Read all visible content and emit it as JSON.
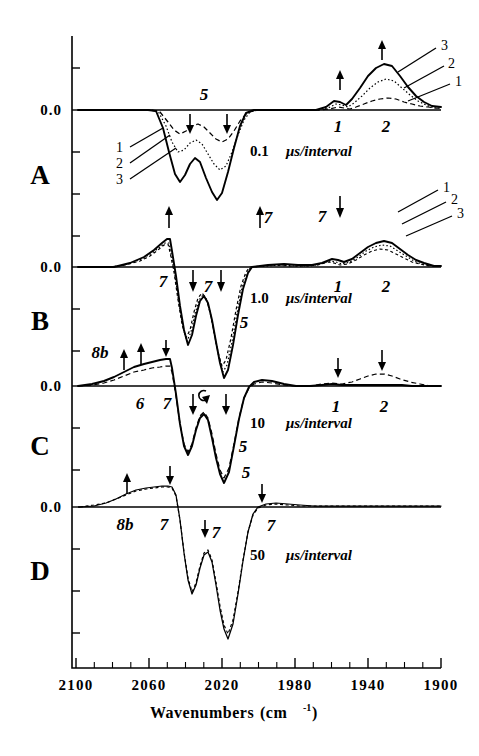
{
  "figure": {
    "kind": "trir-difference-spectra",
    "x_title_main": "Wavenumbers",
    "x_title_unit_open": "(cm",
    "x_title_unit_sup": "-1",
    "x_title_unit_close": ")",
    "zero_label": "0.0"
  },
  "xaxis": {
    "ticks": [
      "2100",
      "2060",
      "2020",
      "1980",
      "1940",
      "1900"
    ],
    "min": 1900,
    "max": 2100,
    "reversed": true,
    "minor_step": 10
  },
  "panels": [
    {
      "letter": "A",
      "interval_value": "0.1",
      "interval_unit": "μs/interval",
      "trace_labels": [
        "1",
        "2",
        "3"
      ],
      "band_labels": [
        "5",
        "1",
        "2"
      ]
    },
    {
      "letter": "B",
      "interval_value": "1.0",
      "interval_unit": "μs/interval",
      "trace_labels": [
        "1",
        "2",
        "3"
      ],
      "band_labels": [
        "7",
        "7",
        "7",
        "7",
        "5",
        "1",
        "2"
      ]
    },
    {
      "letter": "C",
      "interval_value": "10",
      "interval_unit": "μs/interval",
      "trace_labels": [],
      "band_labels": [
        "8b",
        "6",
        "7",
        "5",
        "1",
        "2"
      ]
    },
    {
      "letter": "D",
      "interval_value": "50",
      "interval_unit": "μs/interval",
      "trace_labels": [],
      "band_labels": [
        "8b",
        "7",
        "7",
        "7",
        "5"
      ]
    }
  ],
  "chart_data": {
    "type": "line",
    "title": "",
    "xlabel": "Wavenumbers (cm-1)",
    "ylabel": "0.0",
    "xlim": [
      2100,
      1900
    ],
    "x_reversed": true,
    "grid": false,
    "legend": "inline trace numbers 1, 2, 3 with leader lines",
    "subplots": [
      {
        "panel": "A",
        "interval": "0.1 μs/interval",
        "annotations": [
          {
            "text": "5",
            "wavenumber": 2032,
            "direction": "negative",
            "arrows": [
              "down",
              "down"
            ]
          },
          {
            "text": "1",
            "wavenumber": 1948,
            "direction": "positive",
            "arrows": [
              "up"
            ]
          },
          {
            "text": "2",
            "wavenumber": 1930,
            "direction": "positive",
            "arrows": [
              "up"
            ]
          }
        ],
        "series": [
          {
            "name": "1",
            "style": "dashed",
            "bands": [
              {
                "center": 2042,
                "amplitude": -0.2,
                "width": 7
              },
              {
                "center": 2025,
                "amplitude": -0.26,
                "width": 8
              },
              {
                "center": 1948,
                "amplitude": 0.05,
                "width": 4
              },
              {
                "center": 1931,
                "amplitude": 0.17,
                "width": 13
              }
            ]
          },
          {
            "name": "2",
            "style": "dotted",
            "bands": [
              {
                "center": 2042,
                "amplitude": -0.42,
                "width": 7
              },
              {
                "center": 2025,
                "amplitude": -0.52,
                "width": 8
              },
              {
                "center": 1948,
                "amplitude": 0.07,
                "width": 4
              },
              {
                "center": 1931,
                "amplitude": 0.36,
                "width": 13
              }
            ]
          },
          {
            "name": "3",
            "style": "solid",
            "bands": [
              {
                "center": 2042,
                "amplitude": -0.62,
                "width": 7
              },
              {
                "center": 2025,
                "amplitude": -0.9,
                "width": 8
              },
              {
                "center": 1948,
                "amplitude": 0.09,
                "width": 4
              },
              {
                "center": 1931,
                "amplitude": 0.58,
                "width": 13
              }
            ]
          }
        ]
      },
      {
        "panel": "B",
        "interval": "1.0 μs/interval",
        "annotations": [
          {
            "text": "7",
            "wavenumber": 2060,
            "direction": "positive",
            "arrows": [
              "up"
            ]
          },
          {
            "text": "7",
            "wavenumber": 2040,
            "direction": "negative",
            "arrows": [
              "down"
            ]
          },
          {
            "text": "7",
            "wavenumber": 2022,
            "direction": "negative",
            "arrows": [
              "down"
            ]
          },
          {
            "text": "7",
            "wavenumber": 1992,
            "direction": "positive",
            "arrows": [
              "up"
            ]
          },
          {
            "text": "5",
            "wavenumber": 2008,
            "direction": "negative",
            "arrows": []
          },
          {
            "text": "1",
            "wavenumber": 1948,
            "direction": "positive",
            "arrows": [
              "down"
            ]
          },
          {
            "text": "2",
            "wavenumber": 1930,
            "direction": "positive",
            "arrows": [
              "down"
            ]
          }
        ],
        "series": [
          {
            "name": "3",
            "style": "solid",
            "bands": [
              {
                "center": 2063,
                "amplitude": 0.22,
                "width": 12
              },
              {
                "center": 2040,
                "amplitude": -0.74,
                "width": 7
              },
              {
                "center": 2012,
                "amplitude": -1.0,
                "width": 9
              },
              {
                "center": 1931,
                "amplitude": 0.22,
                "width": 14
              }
            ]
          },
          {
            "name": "2",
            "style": "dotted",
            "bands": [
              {
                "center": 2063,
                "amplitude": 0.16,
                "width": 12
              },
              {
                "center": 2040,
                "amplitude": -0.7,
                "width": 7
              },
              {
                "center": 2012,
                "amplitude": -0.92,
                "width": 9
              },
              {
                "center": 1931,
                "amplitude": 0.3,
                "width": 14
              }
            ]
          },
          {
            "name": "1",
            "style": "dashed",
            "bands": [
              {
                "center": 2063,
                "amplitude": 0.1,
                "width": 12
              },
              {
                "center": 2040,
                "amplitude": -0.66,
                "width": 7
              },
              {
                "center": 2012,
                "amplitude": -0.86,
                "width": 9
              },
              {
                "center": 1931,
                "amplitude": 0.38,
                "width": 14
              }
            ]
          }
        ]
      },
      {
        "panel": "C",
        "interval": "10 μs/interval",
        "annotations": [
          {
            "text": "8b",
            "wavenumber": 2085,
            "direction": "positive",
            "arrows": [
              "up",
              "up"
            ]
          },
          {
            "text": "6",
            "wavenumber": 2070,
            "direction": "positive",
            "arrows": []
          },
          {
            "text": "7",
            "wavenumber": 2058,
            "direction": "positive",
            "arrows": [
              "down-hook"
            ]
          },
          {
            "text": "7",
            "wavenumber": 2040,
            "direction": "negative",
            "arrows": [
              "down"
            ]
          },
          {
            "text": "5",
            "wavenumber": 2010,
            "direction": "negative",
            "arrows": [
              "down"
            ]
          },
          {
            "text": "1",
            "wavenumber": 1948,
            "direction": "positive",
            "arrows": [
              "down"
            ]
          },
          {
            "text": "2",
            "wavenumber": 1930,
            "direction": "positive",
            "arrows": [
              "down"
            ]
          }
        ],
        "series": [
          {
            "name": "late",
            "style": "solid",
            "bands": [
              {
                "center": 2075,
                "amplitude": 0.3,
                "width": 18
              },
              {
                "center": 2040,
                "amplitude": -0.78,
                "width": 7
              },
              {
                "center": 2012,
                "amplitude": -1.0,
                "width": 9
              }
            ]
          },
          {
            "name": "mid",
            "style": "dashed",
            "bands": [
              {
                "center": 2073,
                "amplitude": 0.24,
                "width": 18
              },
              {
                "center": 2040,
                "amplitude": -0.74,
                "width": 7
              },
              {
                "center": 2012,
                "amplitude": -0.94,
                "width": 9
              },
              {
                "center": 1931,
                "amplitude": 0.1,
                "width": 14
              }
            ]
          }
        ]
      },
      {
        "panel": "D",
        "interval": "50 μs/interval",
        "annotations": [
          {
            "text": "8b",
            "wavenumber": 2082,
            "direction": "positive",
            "arrows": [
              "up"
            ]
          },
          {
            "text": "7",
            "wavenumber": 2060,
            "direction": "positive",
            "arrows": [
              "down"
            ]
          },
          {
            "text": "7",
            "wavenumber": 2025,
            "direction": "negative",
            "arrows": [
              "down"
            ]
          },
          {
            "text": "5",
            "wavenumber": 2008,
            "direction": "negative",
            "arrows": []
          },
          {
            "text": "7",
            "wavenumber": 1988,
            "direction": "positive",
            "arrows": [
              "down"
            ]
          }
        ],
        "series": [
          {
            "name": "solid",
            "style": "solid",
            "bands": [
              {
                "center": 2072,
                "amplitude": 0.3,
                "width": 20
              },
              {
                "center": 2040,
                "amplitude": -0.8,
                "width": 7
              },
              {
                "center": 2014,
                "amplitude": -1.05,
                "width": 8
              }
            ]
          }
        ]
      }
    ]
  }
}
